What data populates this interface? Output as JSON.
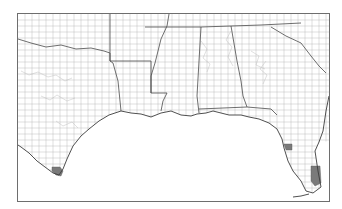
{
  "map": {
    "title": "Southern US county map (Texas to Florida)",
    "region": "Gulf Coast states",
    "states": [
      "Texas",
      "Oklahoma",
      "Arkansas",
      "Louisiana",
      "Mississippi",
      "Alabama",
      "Georgia",
      "Florida",
      "Tennessee",
      "South Carolina"
    ],
    "highlight_color": "#7a7a7a",
    "boundary_color": "#4a4a4a",
    "county_line_color": "#b9b9b9",
    "highlighted_counties": [
      {
        "state": "Texas",
        "location": "southern tip (Cameron area)"
      },
      {
        "state": "Florida",
        "location": "west coast (Tampa Bay area)"
      },
      {
        "state": "Florida",
        "location": "southeast (Miami-Dade area)"
      }
    ]
  }
}
